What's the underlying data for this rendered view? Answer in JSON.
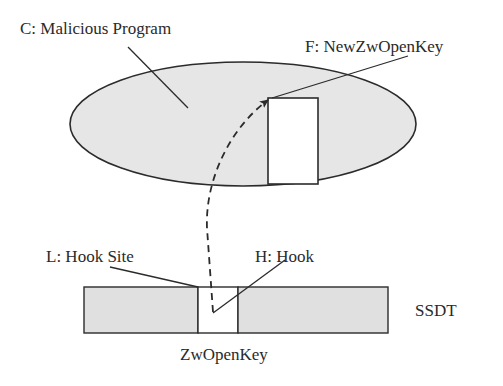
{
  "diagram": {
    "labels": {
      "malicious_program": "C: Malicious Program",
      "new_function": "F: NewZwOpenKey",
      "hook_site": "L: Hook Site",
      "hook": "H: Hook",
      "ssdt": "SSDT",
      "entry": "ZwOpenKey"
    },
    "colors": {
      "fill_gray": "#e6e6e6",
      "stroke": "#2b2b2b",
      "text": "#2a2a2a",
      "background": "#ffffff"
    }
  }
}
